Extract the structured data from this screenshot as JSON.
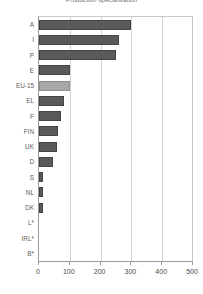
{
  "chart_data": {
    "type": "bar",
    "orientation": "horizontal",
    "title": "Production specialisation",
    "xlabel": "",
    "ylabel": "",
    "xlim": [
      0,
      500
    ],
    "xticks": [
      0,
      100,
      200,
      300,
      400,
      500
    ],
    "xtick_labels": [
      "0",
      "100",
      "200",
      "300",
      "400",
      "500"
    ],
    "grid": true,
    "grid_axis": "x",
    "legend": false,
    "categories": [
      "A",
      "I",
      "P",
      "E",
      "EU-15",
      "EL",
      "F",
      "FIN",
      "UK",
      "D",
      "S",
      "NL",
      "DK",
      "L*",
      "IRL*",
      "B*"
    ],
    "values": [
      300,
      260,
      250,
      102,
      100,
      80,
      73,
      63,
      57,
      45,
      14,
      13,
      12,
      0,
      0,
      0
    ],
    "bar_colors": [
      "#5a5a5a",
      "#5a5a5a",
      "#5a5a5a",
      "#5a5a5a",
      "#a8a8a8",
      "#5a5a5a",
      "#5a5a5a",
      "#5a5a5a",
      "#5a5a5a",
      "#5a5a5a",
      "#5a5a5a",
      "#5a5a5a",
      "#5a5a5a",
      "#5a5a5a",
      "#5a5a5a",
      "#5a5a5a"
    ],
    "highlight_category": "EU-15",
    "highlight_color": "#a8a8a8",
    "series_color": "#5a5a5a",
    "grid_color": "#d2d2d2",
    "axis_color": "#9a9a9a",
    "background": "#ffffff"
  }
}
